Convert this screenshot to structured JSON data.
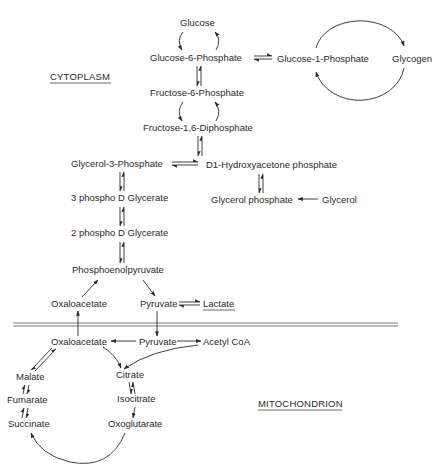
{
  "diagram": {
    "regions": {
      "cytoplasm": "CYTOPLASM",
      "mitochondrion": "MITOCHONDRION"
    },
    "nodes": {
      "glucose": "Glucose",
      "glucose_6_phosphate": "Glucose-6-Phosphate",
      "glucose_1_phosphate": "Glucose-1-Phosphate",
      "glycogen": "Glycogen",
      "fructose_6_phosphate": "Fructose-6-Phosphate",
      "fructose_1_6_diphosphate": "Fructose-1,6-Diphosphate",
      "glycerol_3_phosphate": "Glycerol-3-Phosphate",
      "dihydroxyacetone_phosphate": "D1-Hydroxyacetone phosphate",
      "glycerol_phosphate": "Glycerol phosphate",
      "glycerol": "Glycerol",
      "phospho_3_glycerate": "3 phospho D Glycerate",
      "phospho_2_glycerate": "2 phospho D Glycerate",
      "phosphoenolpyruvate": "Phosphoenolpyruvate",
      "oxaloacetate_cyto": "Oxaloacetate",
      "pyruvate_cyto": "Pyruvate",
      "lactate": "Lactate",
      "oxaloacetate_mito": "Oxaloacetate",
      "pyruvate_mito": "Pyruvate",
      "acetyl_coa": "Acetyl CoA",
      "citrate": "Citrate",
      "isocitrate": "Isocitrate",
      "oxoglutarate": "Oxoglutarate",
      "succinate": "Succinate",
      "fumarate": "Fumarate",
      "malate": "Malate"
    },
    "edges": [
      {
        "from": "Glucose",
        "to": "Glucose-6-Phosphate",
        "type": "curved-pair"
      },
      {
        "from": "Glucose-6-Phosphate",
        "to": "Glucose-1-Phosphate",
        "type": "reversible"
      },
      {
        "from": "Glucose-1-Phosphate",
        "to": "Glycogen",
        "type": "cycle"
      },
      {
        "from": "Glucose-6-Phosphate",
        "to": "Fructose-6-Phosphate",
        "type": "reversible"
      },
      {
        "from": "Fructose-6-Phosphate",
        "to": "Fructose-1,6-Diphosphate",
        "type": "curved-pair"
      },
      {
        "from": "Fructose-1,6-Diphosphate",
        "to": "Glycerol-3-Phosphate",
        "type": "reversible"
      },
      {
        "from": "Glycerol-3-Phosphate",
        "to": "D1-Hydroxyacetone phosphate",
        "type": "reversible"
      },
      {
        "from": "D1-Hydroxyacetone phosphate",
        "to": "Glycerol phosphate",
        "type": "reversible"
      },
      {
        "from": "Glycerol",
        "to": "Glycerol phosphate",
        "type": "forward"
      },
      {
        "from": "Glycerol-3-Phosphate",
        "to": "3 phospho D Glycerate",
        "type": "reversible"
      },
      {
        "from": "3 phospho D Glycerate",
        "to": "2 phospho D Glycerate",
        "type": "reversible"
      },
      {
        "from": "2 phospho D Glycerate",
        "to": "Phosphoenolpyruvate",
        "type": "reversible"
      },
      {
        "from": "Oxaloacetate (cytoplasm)",
        "to": "Phosphoenolpyruvate",
        "type": "forward"
      },
      {
        "from": "Phosphoenolpyruvate",
        "to": "Pyruvate (cytoplasm)",
        "type": "forward"
      },
      {
        "from": "Pyruvate (cytoplasm)",
        "to": "Lactate",
        "type": "reversible"
      },
      {
        "from": "Pyruvate (cytoplasm)",
        "to": "Pyruvate (mitochondrion)",
        "type": "forward"
      },
      {
        "from": "Oxaloacetate (mitochondrion)",
        "to": "Oxaloacetate (cytoplasm)",
        "type": "forward"
      },
      {
        "from": "Pyruvate (mitochondrion)",
        "to": "Oxaloacetate (mitochondrion)",
        "type": "forward"
      },
      {
        "from": "Pyruvate (mitochondrion)",
        "to": "Acetyl CoA",
        "type": "forward"
      },
      {
        "from": "Acetyl CoA",
        "to": "Citrate",
        "type": "forward"
      },
      {
        "from": "Oxaloacetate (mitochondrion)",
        "to": "Citrate",
        "type": "forward"
      },
      {
        "from": "Citrate",
        "to": "Isocitrate",
        "type": "reversible"
      },
      {
        "from": "Isocitrate",
        "to": "Oxoglutarate",
        "type": "forward"
      },
      {
        "from": "Oxoglutarate",
        "to": "Succinate",
        "type": "forward"
      },
      {
        "from": "Succinate",
        "to": "Fumarate",
        "type": "reversible"
      },
      {
        "from": "Fumarate",
        "to": "Malate",
        "type": "reversible"
      },
      {
        "from": "Malate",
        "to": "Oxaloacetate (mitochondrion)",
        "type": "reversible"
      }
    ]
  }
}
